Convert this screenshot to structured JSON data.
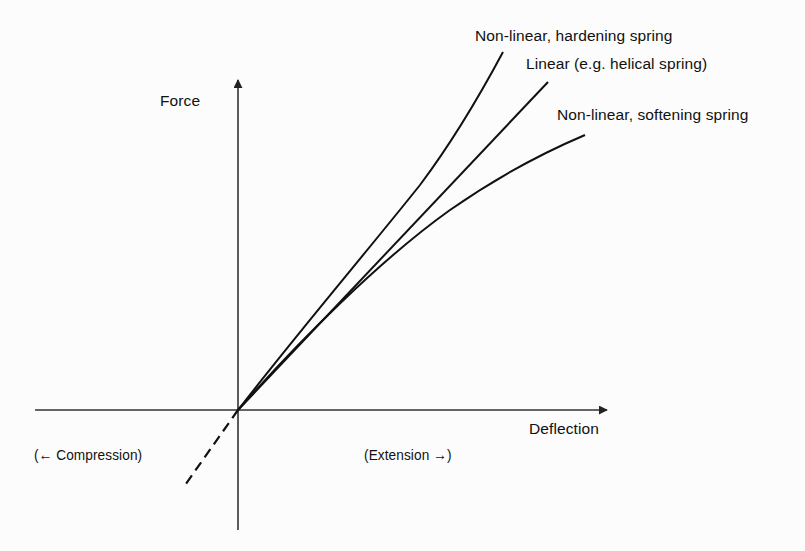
{
  "figure": {
    "axes": {
      "y_label": "Force",
      "x_label": "Deflection",
      "negative_x_annotation": "(← Compression)",
      "positive_x_annotation": "(Extension →)"
    },
    "curves": [
      {
        "id": "hardening",
        "label": "Non-linear, hardening spring",
        "style": "solid"
      },
      {
        "id": "linear",
        "label": "Linear (e.g. helical spring)",
        "style": "solid"
      },
      {
        "id": "softening",
        "label": "Non-linear, softening spring",
        "style": "solid"
      },
      {
        "id": "linear-compression",
        "label": "",
        "style": "dashed"
      }
    ],
    "colors": {
      "ink": "#111111",
      "axis": "#333333",
      "paper": "#fcfcfc"
    }
  }
}
